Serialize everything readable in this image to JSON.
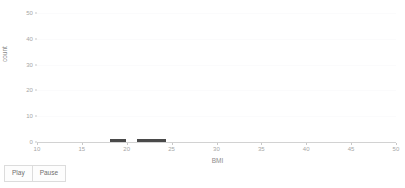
{
  "chart_data": {
    "type": "bar",
    "title": "",
    "subtitle": "",
    "xlabel": "BMI",
    "ylabel": "count",
    "xlim": [
      10,
      50
    ],
    "ylim": [
      0,
      52
    ],
    "xticks": [
      10,
      15,
      20,
      25,
      30,
      35,
      40,
      45,
      50
    ],
    "yticks": [
      0,
      10,
      20,
      30,
      40,
      50
    ],
    "xtick_labels": [
      "10",
      "15",
      "20",
      "25",
      "30",
      "35",
      "40",
      "45",
      "50"
    ],
    "ytick_labels": [
      "0",
      "10",
      "20",
      "30",
      "40",
      "50"
    ],
    "grid": true,
    "legend": null,
    "bar_color": "#4a4a4a",
    "grid_color": "#fbfbfc",
    "axis_color": "#d2d2d2",
    "bars": [
      {
        "x_start": 18.1,
        "x_end": 19.9,
        "value": 1
      },
      {
        "x_start": 21.1,
        "x_end": 24.4,
        "value": 1
      }
    ],
    "categories": [
      "18.1-19.9",
      "21.1-24.4"
    ],
    "values": [
      1,
      1
    ]
  },
  "controls": {
    "play_label": "Play",
    "pause_label": "Pause"
  }
}
